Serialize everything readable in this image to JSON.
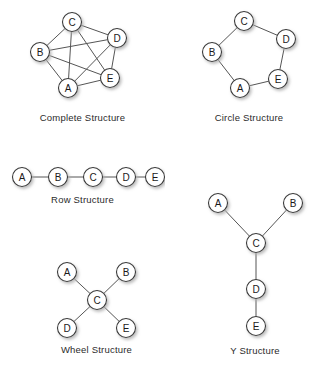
{
  "figure": {
    "node_labels": [
      "A",
      "B",
      "C",
      "D",
      "E"
    ],
    "colors": {
      "background": "#ffffff",
      "node_fill": "#ffffff",
      "node_stroke": "#3a3a3a",
      "edge": "#555555",
      "label_text": "#1a1a1a",
      "caption_text": "#2b2b2b",
      "shadow": "#b0b0b0"
    },
    "panels": [
      {
        "id": "complete",
        "caption": "Complete Structure",
        "viewbox": "0 0 165 110",
        "nodes": [
          {
            "label": "A",
            "x": 68,
            "y": 88
          },
          {
            "label": "B",
            "x": 40,
            "y": 52
          },
          {
            "label": "C",
            "x": 72,
            "y": 22
          },
          {
            "label": "D",
            "x": 117,
            "y": 38
          },
          {
            "label": "E",
            "x": 110,
            "y": 78
          }
        ],
        "edges": [
          [
            "A",
            "B"
          ],
          [
            "A",
            "C"
          ],
          [
            "A",
            "D"
          ],
          [
            "A",
            "E"
          ],
          [
            "B",
            "C"
          ],
          [
            "B",
            "D"
          ],
          [
            "B",
            "E"
          ],
          [
            "C",
            "D"
          ],
          [
            "C",
            "E"
          ],
          [
            "D",
            "E"
          ]
        ]
      },
      {
        "id": "circle",
        "caption": "Circle Structure",
        "viewbox": "0 0 162 110",
        "nodes": [
          {
            "label": "A",
            "x": 72,
            "y": 88
          },
          {
            "label": "B",
            "x": 44,
            "y": 52
          },
          {
            "label": "C",
            "x": 76,
            "y": 21
          },
          {
            "label": "D",
            "x": 118,
            "y": 39
          },
          {
            "label": "E",
            "x": 110,
            "y": 79
          }
        ],
        "edges": [
          [
            "A",
            "B"
          ],
          [
            "B",
            "C"
          ],
          [
            "C",
            "D"
          ],
          [
            "D",
            "E"
          ],
          [
            "E",
            "A"
          ]
        ]
      },
      {
        "id": "row",
        "caption": "Row Structure",
        "viewbox": "0 0 165 30",
        "nodes": [
          {
            "label": "A",
            "x": 22,
            "y": 15
          },
          {
            "label": "B",
            "x": 58,
            "y": 15
          },
          {
            "label": "C",
            "x": 93,
            "y": 15
          },
          {
            "label": "D",
            "x": 126,
            "y": 15
          },
          {
            "label": "E",
            "x": 155,
            "y": 15
          }
        ],
        "edges": [
          [
            "A",
            "B"
          ],
          [
            "B",
            "C"
          ],
          [
            "C",
            "D"
          ],
          [
            "D",
            "E"
          ]
        ]
      },
      {
        "id": "wheel",
        "caption": "Wheel Structure",
        "viewbox": "0 0 165 92",
        "nodes": [
          {
            "label": "A",
            "x": 53,
            "y": 22
          },
          {
            "label": "B",
            "x": 112,
            "y": 22
          },
          {
            "label": "C",
            "x": 83,
            "y": 50
          },
          {
            "label": "D",
            "x": 53,
            "y": 78
          },
          {
            "label": "E",
            "x": 112,
            "y": 78
          }
        ],
        "edges": [
          [
            "C",
            "A"
          ],
          [
            "C",
            "B"
          ],
          [
            "C",
            "D"
          ],
          [
            "C",
            "E"
          ]
        ]
      },
      {
        "id": "y",
        "caption": "Y Structure",
        "viewbox": "0 0 150 155",
        "nodes": [
          {
            "label": "A",
            "x": 38,
            "y": 17
          },
          {
            "label": "B",
            "x": 113,
            "y": 17
          },
          {
            "label": "C",
            "x": 76,
            "y": 57
          },
          {
            "label": "D",
            "x": 76,
            "y": 103
          },
          {
            "label": "E",
            "x": 76,
            "y": 140
          }
        ],
        "edges": [
          [
            "A",
            "C"
          ],
          [
            "B",
            "C"
          ],
          [
            "C",
            "D"
          ],
          [
            "D",
            "E"
          ]
        ]
      }
    ]
  }
}
